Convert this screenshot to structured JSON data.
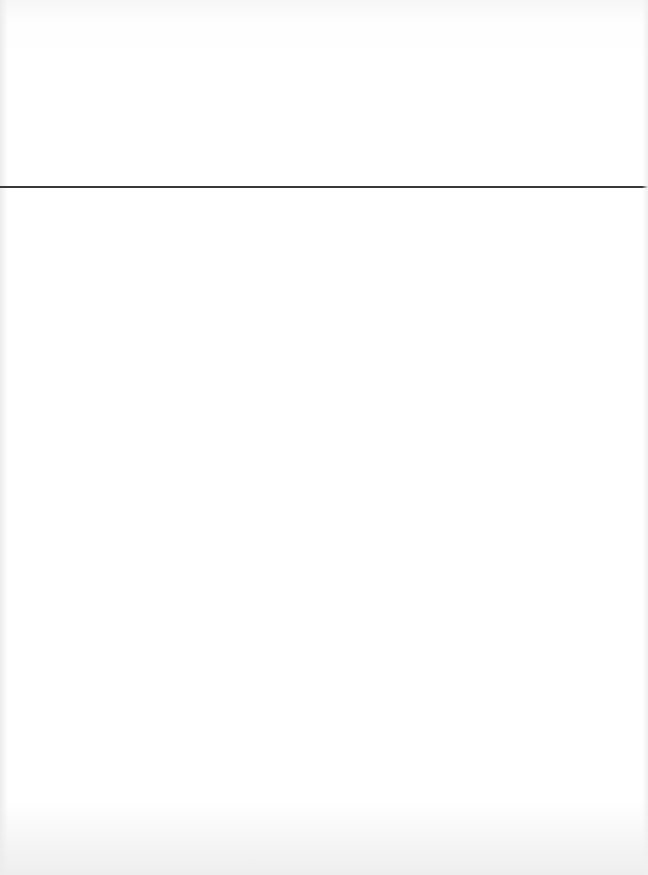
{
  "page": {
    "type": "blank-scanned-page",
    "header_text": "",
    "body_text": "",
    "rule": {
      "top_px": 186,
      "color": "#3a3a3a"
    },
    "colors": {
      "paper": "#ffffff",
      "edge_shading": "#eeeeee"
    }
  }
}
